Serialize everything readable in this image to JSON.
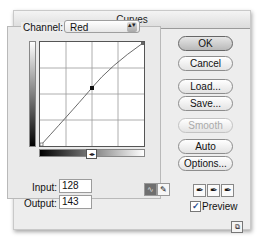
{
  "window": {
    "title": "Curves"
  },
  "channel": {
    "label": "Channel:",
    "value": "Red",
    "arrows_glyph": "▴▾"
  },
  "graph": {
    "grid_divisions": 4,
    "curve_points": [
      [
        0,
        0
      ],
      [
        128,
        143
      ],
      [
        255,
        255
      ]
    ],
    "selected_point": {
      "input": 128,
      "output": 143
    },
    "slider_glyph": "◂▸"
  },
  "io": {
    "input_label": "Input:",
    "input_value": "128",
    "output_label": "Output:",
    "output_value": "143"
  },
  "tools": {
    "curve_tool_glyph": "∿",
    "pencil_tool_glyph": "✎"
  },
  "buttons": {
    "ok": "OK",
    "cancel": "Cancel",
    "load": "Load...",
    "save": "Save...",
    "smooth": "Smooth",
    "auto": "Auto",
    "options": "Options..."
  },
  "eyedroppers": {
    "black": "✒",
    "gray": "✒",
    "white": "✒"
  },
  "preview": {
    "label": "Preview",
    "checked": true,
    "check_glyph": "✓"
  },
  "resize_glyph": "⧉"
}
